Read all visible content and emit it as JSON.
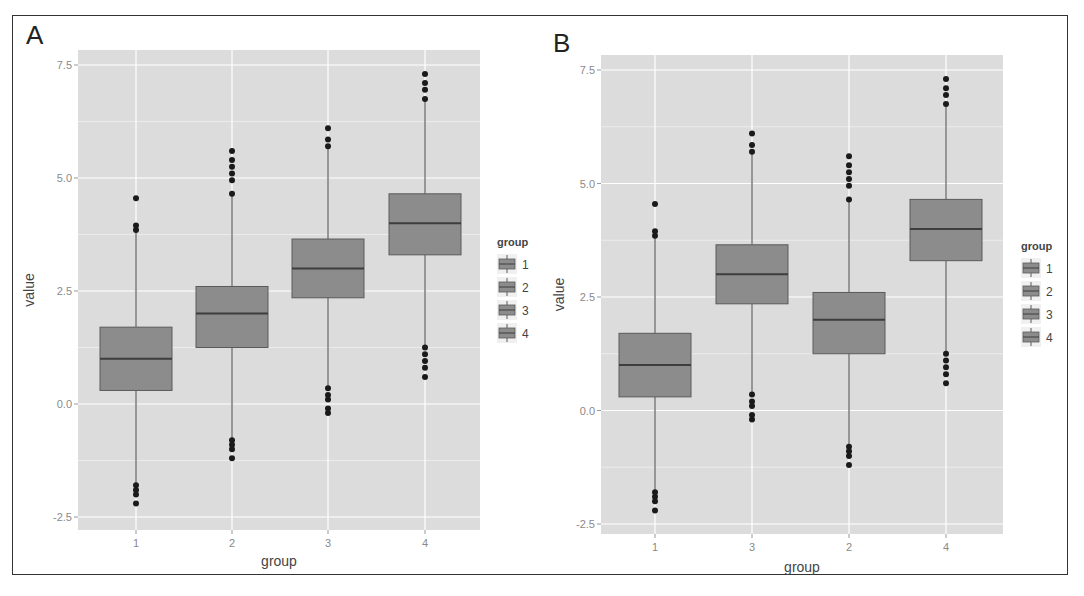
{
  "figure": {
    "panels": [
      "A",
      "B"
    ]
  },
  "chart_data": [
    {
      "panel": "A",
      "type": "boxplot",
      "title": "",
      "xlabel": "group",
      "ylabel": "value",
      "ylim": [
        -2.75,
        7.85
      ],
      "yticks": [
        "-2.5",
        "0.0",
        "2.5",
        "5.0",
        "7.5"
      ],
      "ytick_values": [
        -2.5,
        0.0,
        2.5,
        5.0,
        7.5
      ],
      "categories": [
        "1",
        "2",
        "3",
        "4"
      ],
      "grid": true,
      "legend": {
        "title": "group",
        "position": "right",
        "entries": [
          "1",
          "2",
          "3",
          "4"
        ]
      },
      "series": [
        {
          "group": "1",
          "q1": 0.3,
          "median": 1.0,
          "q3": 1.7,
          "whisker_low": -1.75,
          "whisker_high": 3.8,
          "outliers": [
            -1.8,
            -1.9,
            -2.0,
            -2.2,
            3.85,
            3.95,
            4.55
          ]
        },
        {
          "group": "2",
          "q1": 1.25,
          "median": 2.0,
          "q3": 2.6,
          "whisker_low": -0.75,
          "whisker_high": 4.6,
          "outliers": [
            -0.8,
            -0.9,
            -1.0,
            -1.2,
            4.65,
            4.95,
            5.1,
            5.25,
            5.4,
            5.6
          ]
        },
        {
          "group": "3",
          "q1": 2.35,
          "median": 3.0,
          "q3": 3.65,
          "whisker_low": 0.4,
          "whisker_high": 5.65,
          "outliers": [
            0.35,
            0.2,
            0.1,
            -0.1,
            -0.2,
            5.7,
            5.85,
            6.1
          ]
        },
        {
          "group": "4",
          "q1": 3.3,
          "median": 4.0,
          "q3": 4.65,
          "whisker_low": 1.3,
          "whisker_high": 6.7,
          "outliers": [
            1.25,
            1.1,
            0.95,
            0.8,
            0.6,
            6.75,
            6.95,
            7.1,
            7.3
          ]
        }
      ]
    },
    {
      "panel": "B",
      "type": "boxplot",
      "title": "",
      "xlabel": "group",
      "ylabel": "value",
      "ylim": [
        -2.75,
        7.85
      ],
      "yticks": [
        "-2.5",
        "0.0",
        "2.5",
        "5.0",
        "7.5"
      ],
      "ytick_values": [
        -2.5,
        0.0,
        2.5,
        5.0,
        7.5
      ],
      "categories": [
        "1",
        "3",
        "2",
        "4"
      ],
      "grid": true,
      "legend": {
        "title": "group",
        "position": "right",
        "entries": [
          "1",
          "2",
          "3",
          "4"
        ]
      },
      "series": [
        {
          "group": "1",
          "q1": 0.3,
          "median": 1.0,
          "q3": 1.7,
          "whisker_low": -1.75,
          "whisker_high": 3.8,
          "outliers": [
            -1.8,
            -1.9,
            -2.0,
            -2.2,
            3.85,
            3.95,
            4.55
          ]
        },
        {
          "group": "3",
          "q1": 2.35,
          "median": 3.0,
          "q3": 3.65,
          "whisker_low": 0.4,
          "whisker_high": 5.65,
          "outliers": [
            0.35,
            0.2,
            0.1,
            -0.1,
            -0.2,
            5.7,
            5.85,
            6.1
          ]
        },
        {
          "group": "2",
          "q1": 1.25,
          "median": 2.0,
          "q3": 2.6,
          "whisker_low": -0.75,
          "whisker_high": 4.6,
          "outliers": [
            -0.8,
            -0.9,
            -1.0,
            -1.2,
            4.65,
            4.95,
            5.1,
            5.25,
            5.4,
            5.6
          ]
        },
        {
          "group": "4",
          "q1": 3.3,
          "median": 4.0,
          "q3": 4.65,
          "whisker_low": 1.3,
          "whisker_high": 6.7,
          "outliers": [
            1.25,
            1.1,
            0.95,
            0.8,
            0.6,
            6.75,
            6.95,
            7.1,
            7.3
          ]
        }
      ]
    }
  ],
  "style": {
    "panel_bg": "#dcdcdc",
    "grid_major": "#ffffff",
    "grid_minor": "#ececec",
    "box_fill": "#8c8c8c",
    "box_stroke": "#5a5a5a",
    "median_stroke": "#3d3d3d",
    "outlier": "#1a1a1a"
  }
}
